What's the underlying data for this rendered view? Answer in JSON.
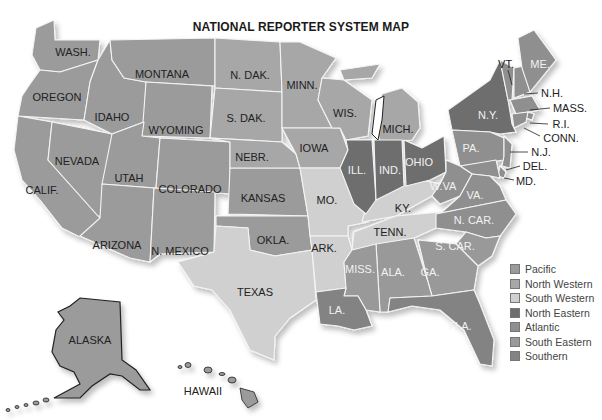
{
  "title": "NATIONAL REPORTER SYSTEM MAP",
  "colors": {
    "pacific": "#9b9b9b",
    "north_western": "#a7a7a7",
    "south_western": "#d0d0d0",
    "north_eastern": "#6e6e6e",
    "atlantic": "#8f8f8f",
    "south_eastern": "#999999",
    "southern": "#838383"
  },
  "legend": [
    {
      "label": "Pacific",
      "color": "#9b9b9b"
    },
    {
      "label": "North Western",
      "color": "#a7a7a7"
    },
    {
      "label": "South Western",
      "color": "#d0d0d0"
    },
    {
      "label": "North Eastern",
      "color": "#6e6e6e"
    },
    {
      "label": "Atlantic",
      "color": "#8f8f8f"
    },
    {
      "label": "South Eastern",
      "color": "#999999"
    },
    {
      "label": "Southern",
      "color": "#838383"
    }
  ],
  "states": {
    "wash": "WASH.",
    "oregon": "OREGON",
    "calif": "CALIF.",
    "nevada": "NEVADA",
    "idaho": "IDAHO",
    "montana": "MONTANA",
    "wyoming": "WYOMING",
    "utah": "UTAH",
    "colorado": "COLORADO",
    "arizona": "ARIZONA",
    "nmexico": "N. MEXICO",
    "ndak": "N. DAK.",
    "sdak": "S. DAK.",
    "nebr": "NEBR.",
    "kansas": "KANSAS",
    "okla": "OKLA.",
    "texas": "TEXAS",
    "minn": "MINN.",
    "iowa": "IOWA",
    "mo": "MO.",
    "ark": "ARK.",
    "la": "LA.",
    "wis": "WIS.",
    "mich": "MICH.",
    "ill": "ILL.",
    "ind": "IND.",
    "ohio": "OHIO",
    "ky": "KY.",
    "tenn": "TENN.",
    "miss": "MISS.",
    "ala": "ALA.",
    "ga": "GA.",
    "fla": "FLA.",
    "scar": "S. CAR.",
    "ncar": "N. CAR.",
    "va": "VA.",
    "wva": "W.VA",
    "pa": "PA.",
    "ny": "N.Y.",
    "vt": "VT.",
    "me": "ME.",
    "nh": "N.H.",
    "mass": "MASS.",
    "ri": "R.I.",
    "conn": "CONN.",
    "nj": "N.J.",
    "del": "DEL.",
    "md": "MD.",
    "alaska": "ALASKA",
    "hawaii": "HAWAII"
  }
}
